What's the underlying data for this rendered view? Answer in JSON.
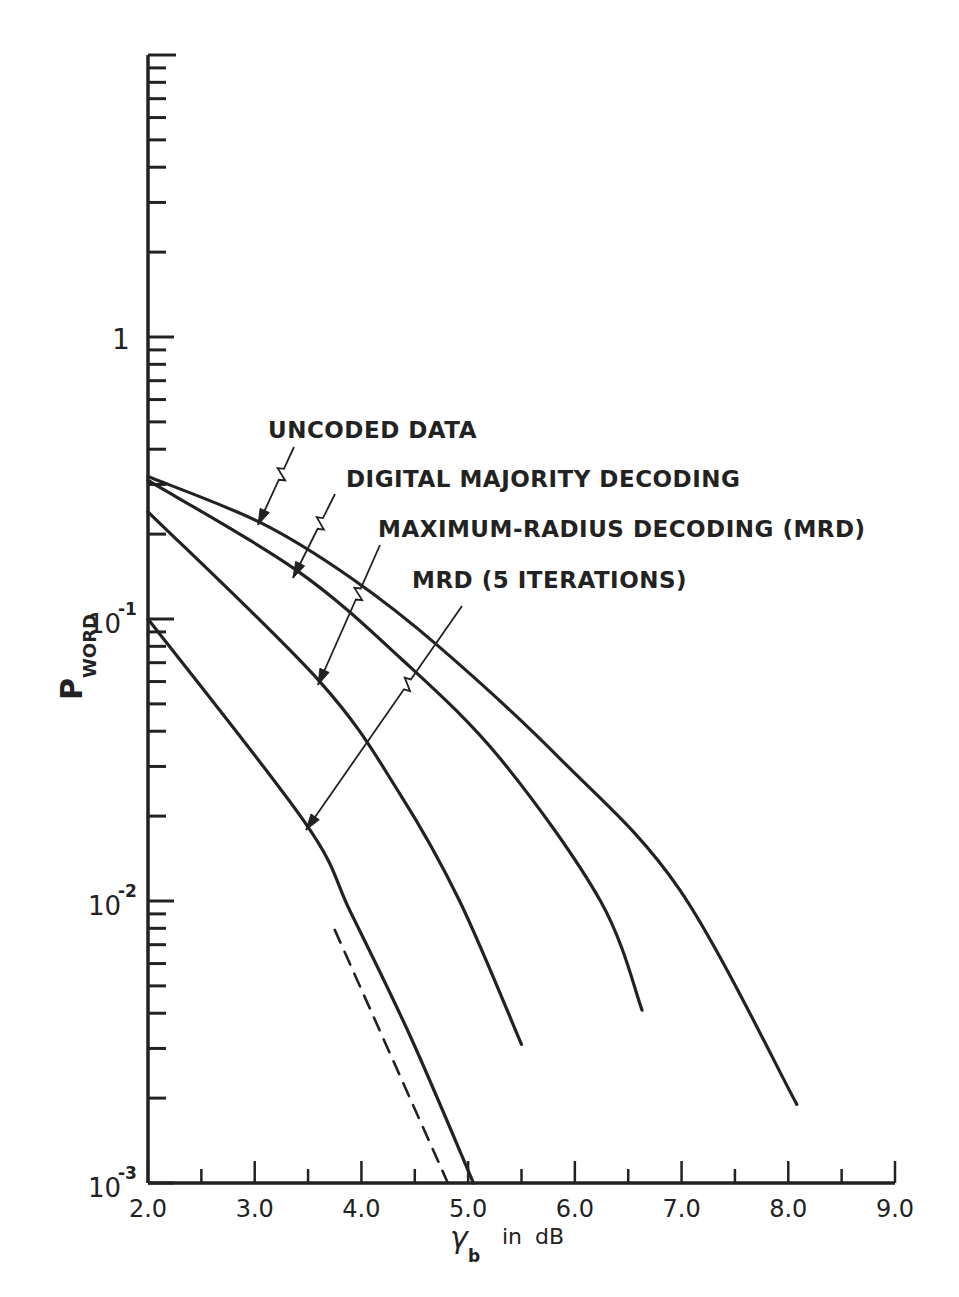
{
  "chart_data": {
    "type": "line",
    "title": "",
    "xlabel": "γb in dB",
    "xlabel_main": "γ",
    "xlabel_sub": "b",
    "xlabel_suffix": "in dB",
    "ylabel": "P_WORD",
    "ylabel_main": "P",
    "ylabel_sub": "WORD",
    "xscale": "linear",
    "yscale": "log",
    "xlim": [
      2.0,
      9.0
    ],
    "ylim": [
      0.001,
      10
    ],
    "grid": false,
    "legend_position": "inline annotations with arrows",
    "x_ticks": [
      "2.0",
      "3.0",
      "4.0",
      "5.0",
      "6.0",
      "7.0",
      "8.0",
      "9.0"
    ],
    "y_ticks": [
      {
        "value": 1,
        "label": "1"
      },
      {
        "value": 0.1,
        "label": "10",
        "exp": "-1"
      },
      {
        "value": 0.01,
        "label": "10",
        "exp": "-2"
      },
      {
        "value": 0.001,
        "label": "10",
        "exp": "-3"
      }
    ],
    "series": [
      {
        "name": "UNCODED DATA",
        "style": "solid",
        "x": [
          2.0,
          3.05,
          3.9,
          4.74,
          5.86,
          6.98,
          8.08
        ],
        "y": [
          0.32,
          0.22,
          0.14,
          0.079,
          0.032,
          0.011,
          0.0019
        ]
      },
      {
        "name": "DIGITAL MAJORITY DECODING",
        "style": "solid",
        "x": [
          2.0,
          3.38,
          4.36,
          5.3,
          6.24,
          6.63
        ],
        "y": [
          0.31,
          0.15,
          0.073,
          0.032,
          0.01,
          0.0041
        ]
      },
      {
        "name": "MAXIMUM-RADIUS DECODING (MRD)",
        "style": "solid",
        "x": [
          2.0,
          3.61,
          4.36,
          4.92,
          5.5
        ],
        "y": [
          0.24,
          0.06,
          0.024,
          0.01,
          0.0031
        ]
      },
      {
        "name": "MRD (5 ITERATIONS)",
        "style": "solid",
        "x": [
          2.0,
          3.47,
          3.9,
          4.46,
          5.05
        ],
        "y": [
          0.1,
          0.019,
          0.0091,
          0.0033,
          0.001
        ]
      },
      {
        "name": "asymptote (unlabeled)",
        "style": "dashed",
        "x": [
          3.75,
          4.81
        ],
        "y": [
          0.0079,
          0.001
        ]
      }
    ],
    "annotations": [
      {
        "text": "UNCODED DATA",
        "points_to": "UNCODED DATA"
      },
      {
        "text": "DIGITAL MAJORITY DECODING",
        "points_to": "DIGITAL MAJORITY DECODING"
      },
      {
        "text": "MAXIMUM-RADIUS DECODING (MRD)",
        "points_to": "MAXIMUM-RADIUS DECODING (MRD)"
      },
      {
        "text": "MRD (5 ITERATIONS)",
        "points_to": "MRD (5 ITERATIONS)"
      }
    ]
  }
}
